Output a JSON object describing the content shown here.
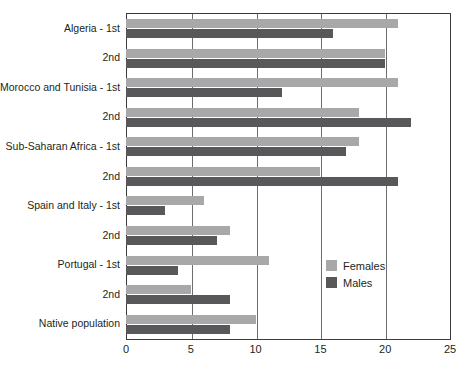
{
  "chart_data": {
    "type": "bar",
    "orientation": "horizontal",
    "title": "",
    "subtitle": "",
    "xlabel": "",
    "ylabel": "",
    "xlim": [
      0,
      25
    ],
    "xticks": [
      0,
      5,
      10,
      15,
      20,
      25
    ],
    "grid": true,
    "grid_axis": "x",
    "legend": {
      "position": "inside-right",
      "entries": [
        {
          "name": "Females",
          "color": "#a8a8a8"
        },
        {
          "name": "Males",
          "color": "#58585a"
        }
      ]
    },
    "categories": [
      "Algeria - 1st",
      "2nd",
      "Morocco and Tunisia - 1st",
      "2nd",
      "Sub-Saharan Africa - 1st",
      "2nd",
      "Spain and Italy - 1st",
      "2nd",
      "Portugal - 1st",
      "2nd",
      "Native population"
    ],
    "series": [
      {
        "name": "Females",
        "color": "#a8a8a8",
        "values": [
          21,
          20,
          21,
          18,
          18,
          15,
          6,
          8,
          11,
          5,
          10
        ]
      },
      {
        "name": "Males",
        "color": "#58585a",
        "values": [
          16,
          20,
          12,
          22,
          17,
          21,
          3,
          7,
          4,
          8,
          8
        ]
      }
    ]
  },
  "axis": {
    "tick_labels": [
      "0",
      "5",
      "10",
      "15",
      "20",
      "25"
    ]
  },
  "colors": {
    "females": "#a8a8a8",
    "males": "#58585a",
    "frame": "#3b3b3b",
    "grid": "#6d6d6d",
    "text": "#231f20"
  }
}
